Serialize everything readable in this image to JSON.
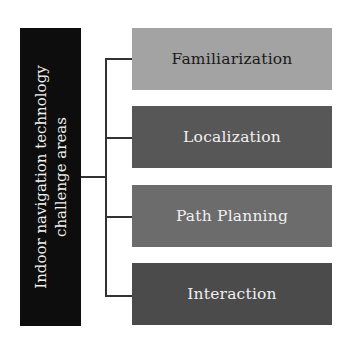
{
  "diagram": {
    "root": {
      "label": "Indoor navigation technology challenge areas",
      "color": "#0d0d0d",
      "text_color": "#f0f0f0"
    },
    "areas": [
      {
        "label": "Familiarization",
        "color": "#a3a3a3",
        "text_color": "#1a1a1a"
      },
      {
        "label": "Localization",
        "color": "#575757",
        "text_color": "#f0f0f0"
      },
      {
        "label": "Path Planning",
        "color": "#6c6c6c",
        "text_color": "#f0f0f0"
      },
      {
        "label": "Interaction",
        "color": "#4b4b4b",
        "text_color": "#f0f0f0"
      }
    ]
  }
}
